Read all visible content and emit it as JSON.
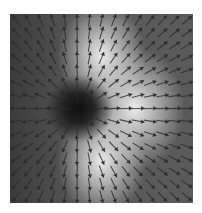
{
  "chart_data": {
    "type": "quiver",
    "title": "",
    "xlabel": "",
    "ylabel": "",
    "grid": false,
    "legend": null,
    "background": {
      "type": "grayscale-intensity-map",
      "description": "dark sink at source point, bright lobes above, below and to the right",
      "dark_center": {
        "x": 0.38,
        "y": 0.5
      },
      "bright_lobes": [
        {
          "x": 0.5,
          "y": 0.22,
          "radius": 0.22
        },
        {
          "x": 0.5,
          "y": 0.78,
          "radius": 0.22
        },
        {
          "x": 0.68,
          "y": 0.5,
          "radius": 0.25
        }
      ],
      "base_gray": "#5a5a5a",
      "dark_color": "#111111",
      "bright_color": "#f4f4f4"
    },
    "field": {
      "pattern": "radial-outward-source",
      "source": {
        "x": 0.38,
        "y": 0.51
      },
      "grid_cols": 15,
      "grid_rows": 15,
      "arrow_length_px": 13,
      "arrow_color": "#2a2a2a"
    }
  }
}
